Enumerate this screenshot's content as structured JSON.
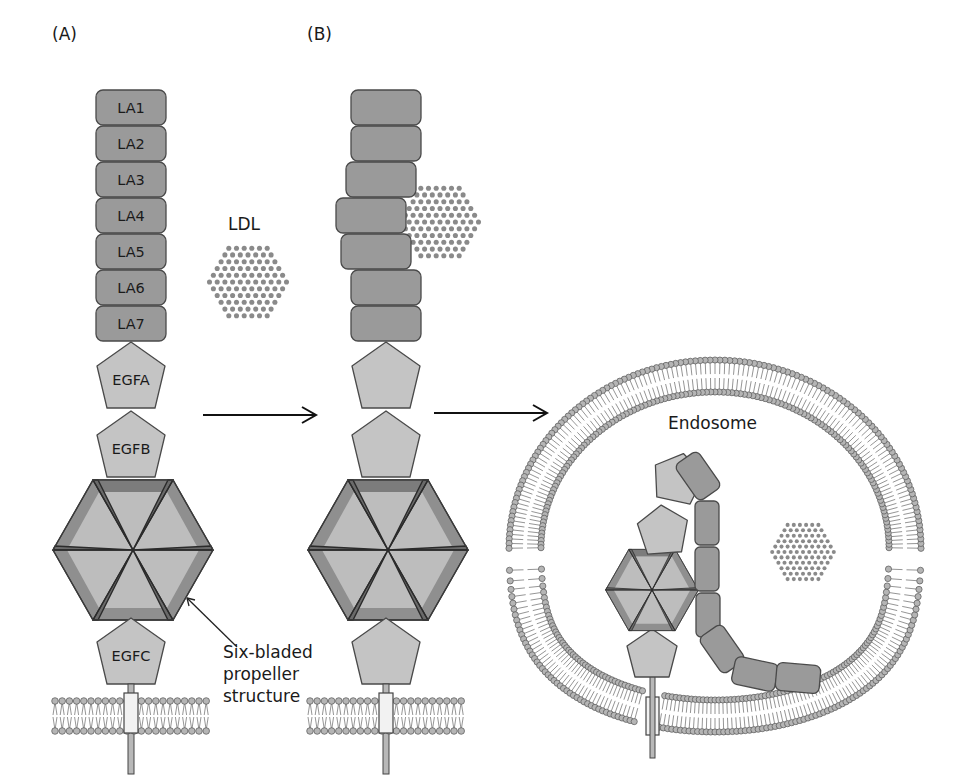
{
  "figure": {
    "panels": [
      {
        "id": "A",
        "label": "(A)"
      },
      {
        "id": "B",
        "label": "(B)"
      }
    ],
    "panel_a": {
      "la_domains": [
        "LA1",
        "LA2",
        "LA3",
        "LA4",
        "LA5",
        "LA6",
        "LA7"
      ],
      "egf_domains": [
        "EGFA",
        "EGFB",
        "EGFC"
      ],
      "ligand_label": "LDL",
      "propeller_annotation": [
        "Six-bladed",
        "propeller",
        "structure"
      ]
    },
    "panel_b": {
      "description": "LDL bound to LA4 and LA5 repeats of receptor"
    },
    "endosome": {
      "label": "Endosome"
    },
    "colors": {
      "la_domain": "#9a9a9a",
      "egf_domain": "#c4c4c4",
      "propeller_light": "#bdbdbd",
      "propeller_dark": "#8c8c8c",
      "ldl_dot": "#8a8a8a",
      "membrane_head": "#b5b5b5"
    }
  }
}
